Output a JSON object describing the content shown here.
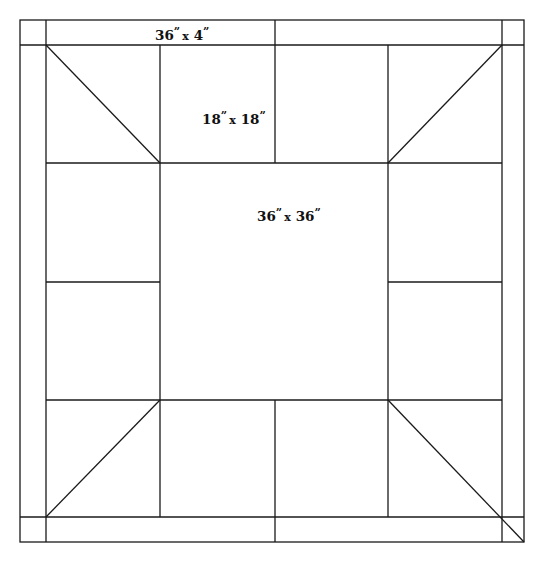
{
  "diagram": {
    "type": "quilt-layout",
    "labels": {
      "border_strip": {
        "num1": "36",
        "num2": "4",
        "sep": "x",
        "text": "36\" x 4\""
      },
      "block": {
        "num1": "18",
        "num2": "18",
        "sep": "x",
        "text": "18\" x 18\""
      },
      "center": {
        "num1": "36",
        "num2": "36",
        "sep": "x",
        "text": "36\" x 36\""
      }
    },
    "quote_mark": "”",
    "colors": {
      "line": "#1a1a1a",
      "background": "#ffffff",
      "text": "#111111"
    }
  }
}
